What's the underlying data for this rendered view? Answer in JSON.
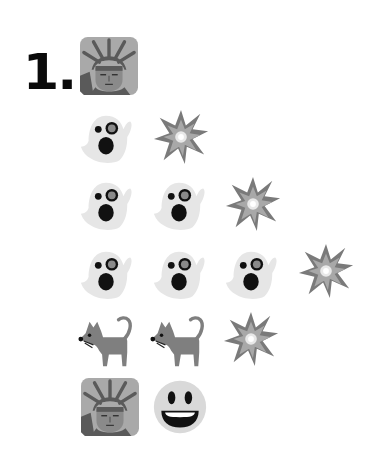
{
  "puzzle": {
    "number_label": "1.",
    "header_icon": "statue-of-liberty-icon",
    "rows": [
      {
        "icons": [
          "ghost-icon",
          "collision-icon"
        ]
      },
      {
        "icons": [
          "ghost-icon",
          "ghost-icon",
          "collision-icon"
        ]
      },
      {
        "icons": [
          "ghost-icon",
          "ghost-icon",
          "ghost-icon",
          "collision-icon"
        ]
      },
      {
        "icons": [
          "cat-icon",
          "cat-icon",
          "collision-icon"
        ]
      },
      {
        "icons": [
          "statue-of-liberty-icon",
          "grinning-face-icon"
        ]
      }
    ]
  },
  "colors": {
    "background": "#ffffff",
    "text": "#0a0a0a",
    "ghost": "#e6e6e6",
    "boom_outer": "#7a7a7a",
    "boom_inner": "#a8a8a8",
    "cat": "#7f7f7f",
    "statue_bg": "#a9a9a9",
    "statue_fg": "#5a5a5a",
    "smiley": "#d9d9d9"
  }
}
